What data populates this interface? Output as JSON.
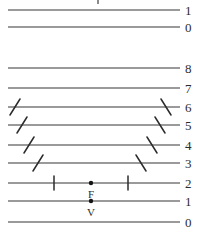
{
  "figure": {
    "width": 197,
    "height": 234,
    "background_color": "#ffffff",
    "line_color": "#9a9a9a",
    "tick_color": "#2b2b2b",
    "dot_color": "#141414",
    "label_color": "#2b2b2b",
    "line_start_x": 8,
    "line_end_x": 180,
    "label_x": 185,
    "top_artifact": {
      "x": 97,
      "y": 0,
      "width": 2,
      "height": 4
    }
  },
  "rows": [
    {
      "label": "1",
      "y": 10,
      "ticks": []
    },
    {
      "label": "0",
      "y": 27,
      "ticks": []
    },
    {
      "label": "8",
      "y": 68,
      "ticks": []
    },
    {
      "label": "7",
      "y": 88,
      "ticks": []
    },
    {
      "label": "6",
      "y": 107,
      "ticks": [
        {
          "kind": "slash",
          "x": 15
        },
        {
          "kind": "backslash",
          "x": 166
        }
      ]
    },
    {
      "label": "5",
      "y": 125,
      "ticks": [
        {
          "kind": "slash",
          "x": 22
        },
        {
          "kind": "backslash",
          "x": 160
        }
      ]
    },
    {
      "label": "4",
      "y": 145,
      "ticks": [
        {
          "kind": "slash",
          "x": 29
        },
        {
          "kind": "backslash",
          "x": 152
        }
      ]
    },
    {
      "label": "3",
      "y": 163,
      "ticks": [
        {
          "kind": "slash",
          "x": 38
        },
        {
          "kind": "backslash",
          "x": 141
        }
      ]
    },
    {
      "label": "2",
      "y": 183,
      "ticks": [
        {
          "kind": "vertical",
          "x": 54
        },
        {
          "kind": "vertical",
          "x": 128
        }
      ]
    },
    {
      "label": "1",
      "y": 201,
      "ticks": []
    },
    {
      "label": "0",
      "y": 222,
      "ticks": []
    }
  ],
  "points": [
    {
      "name": "F",
      "x": 91,
      "y": 183,
      "label_dy": 12
    },
    {
      "name": "V",
      "x": 91,
      "y": 201,
      "label_dy": 12
    }
  ]
}
